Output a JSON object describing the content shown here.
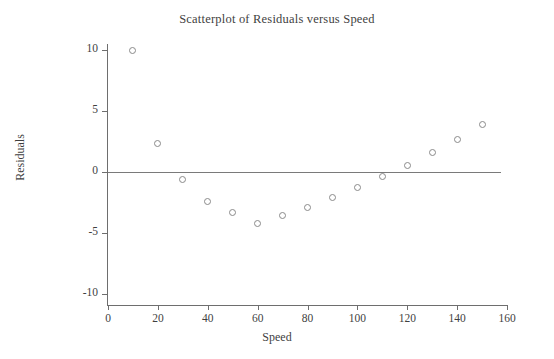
{
  "chart_data": {
    "type": "scatter",
    "title": "Scatterplot of Residuals versus Speed",
    "xlabel": "Speed",
    "ylabel": "Residuals",
    "xlim": [
      0,
      160
    ],
    "ylim": [
      -10,
      10
    ],
    "xticks": [
      0,
      20,
      40,
      60,
      80,
      100,
      120,
      140,
      160
    ],
    "yticks": [
      10,
      5,
      0,
      -5,
      -10
    ],
    "xticklabels": [
      "0",
      "20",
      "40",
      "60",
      "80",
      "100",
      "120",
      "140",
      "160"
    ],
    "yticklabels": [
      "10",
      "5",
      "0",
      "-5",
      "-10"
    ],
    "grid": false,
    "legend": false,
    "reference_line": {
      "y": 0,
      "label": "zero-residual-line",
      "color": "#7a7a7a"
    },
    "marker": {
      "shape": "open-circle",
      "size": 7,
      "edge_color": "#8a8a8a",
      "fill": "none"
    },
    "x": [
      10,
      20,
      30,
      40,
      50,
      60,
      70,
      80,
      90,
      100,
      110,
      120,
      130,
      140,
      150
    ],
    "y": [
      10.0,
      2.3,
      -0.6,
      -2.4,
      -3.3,
      -4.2,
      -3.6,
      -2.9,
      -2.1,
      -1.3,
      -0.4,
      0.5,
      1.6,
      2.7,
      3.9
    ],
    "points": [
      {
        "x": 10,
        "y": 10.0
      },
      {
        "x": 20,
        "y": 2.3
      },
      {
        "x": 30,
        "y": -0.6
      },
      {
        "x": 40,
        "y": -2.4
      },
      {
        "x": 50,
        "y": -3.3
      },
      {
        "x": 60,
        "y": -4.2
      },
      {
        "x": 70,
        "y": -3.6
      },
      {
        "x": 80,
        "y": -2.9
      },
      {
        "x": 90,
        "y": -2.1
      },
      {
        "x": 100,
        "y": -1.3
      },
      {
        "x": 110,
        "y": -0.4
      },
      {
        "x": 120,
        "y": 0.5
      },
      {
        "x": 130,
        "y": 1.6
      },
      {
        "x": 140,
        "y": 2.7
      },
      {
        "x": 150,
        "y": 3.9
      }
    ]
  },
  "colors": {
    "background": "#ffffff",
    "axis": "#6e6e6e",
    "text": "#3f3f3f",
    "marker_edge": "#8a8a8a",
    "reference_line": "#7a7a7a"
  }
}
